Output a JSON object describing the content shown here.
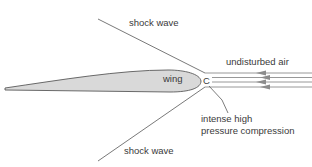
{
  "diagram": {
    "labels": {
      "shock_wave_top": "shock wave",
      "shock_wave_bottom": "shock wave",
      "undisturbed_air": "undisturbed air",
      "wing": "wing",
      "point_c": "C",
      "compression_line1": "intense high",
      "compression_line2": "pressure compression"
    },
    "colors": {
      "wing_fill": "#d9d9d9",
      "outline": "#5a5a5a",
      "airflow": "#8c8c8c",
      "text": "#3a3a3a"
    }
  }
}
